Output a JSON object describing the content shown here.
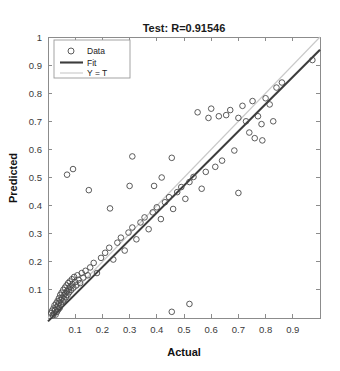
{
  "figure": {
    "title": "Test: R=0.91546",
    "xlabel": "Actual",
    "ylabel": "Predicted"
  },
  "legend": {
    "items": [
      {
        "label": "Data",
        "marker": "circle-marker-icon",
        "color": "#4a4a4a"
      },
      {
        "label": "Fit",
        "marker": "solid-line-icon",
        "color": "#3d3d3d"
      },
      {
        "label": "Y = T",
        "marker": "light-line-icon",
        "color": "#c9c9c9"
      }
    ]
  },
  "colors": {
    "data_marker": "#4a4a4a",
    "fit_line": "#3d3d3d",
    "identity_line": "#c9c9c9",
    "axis": "#8c8c8c",
    "text": "#1a1a1a",
    "background": "#ffffff"
  },
  "chart_data": {
    "type": "scatter",
    "title": "Test: R=0.91546",
    "xlabel": "Actual",
    "ylabel": "Predicted",
    "xlim": [
      0,
      1
    ],
    "ylim": [
      0,
      1
    ],
    "grid": false,
    "legend_position": "upper-left",
    "xticks": [
      0.1,
      0.2,
      0.3,
      0.4,
      0.5,
      0.6,
      0.7,
      0.8,
      0.9
    ],
    "yticks": [
      0.1,
      0.2,
      0.3,
      0.4,
      0.5,
      0.6,
      0.7,
      0.8,
      0.9,
      1
    ],
    "r_value": 0.91546,
    "series": [
      {
        "name": "Data",
        "type": "scatter",
        "points": [
          [
            0.012,
            0.018
          ],
          [
            0.015,
            0.026
          ],
          [
            0.018,
            0.01
          ],
          [
            0.02,
            0.034
          ],
          [
            0.022,
            0.016
          ],
          [
            0.024,
            0.045
          ],
          [
            0.026,
            0.028
          ],
          [
            0.028,
            0.012
          ],
          [
            0.03,
            0.052
          ],
          [
            0.031,
            0.038
          ],
          [
            0.033,
            0.022
          ],
          [
            0.035,
            0.06
          ],
          [
            0.036,
            0.044
          ],
          [
            0.038,
            0.03
          ],
          [
            0.04,
            0.07
          ],
          [
            0.041,
            0.054
          ],
          [
            0.043,
            0.036
          ],
          [
            0.045,
            0.082
          ],
          [
            0.046,
            0.064
          ],
          [
            0.048,
            0.048
          ],
          [
            0.05,
            0.09
          ],
          [
            0.052,
            0.072
          ],
          [
            0.054,
            0.058
          ],
          [
            0.056,
            0.1
          ],
          [
            0.058,
            0.08
          ],
          [
            0.06,
            0.066
          ],
          [
            0.062,
            0.108
          ],
          [
            0.064,
            0.088
          ],
          [
            0.066,
            0.074
          ],
          [
            0.068,
            0.116
          ],
          [
            0.07,
            0.096
          ],
          [
            0.072,
            0.082
          ],
          [
            0.074,
            0.124
          ],
          [
            0.076,
            0.104
          ],
          [
            0.078,
            0.092
          ],
          [
            0.08,
            0.13
          ],
          [
            0.082,
            0.112
          ],
          [
            0.085,
            0.1
          ],
          [
            0.088,
            0.138
          ],
          [
            0.09,
            0.12
          ],
          [
            0.093,
            0.108
          ],
          [
            0.096,
            0.146
          ],
          [
            0.1,
            0.128
          ],
          [
            0.104,
            0.116
          ],
          [
            0.108,
            0.152
          ],
          [
            0.112,
            0.136
          ],
          [
            0.118,
            0.124
          ],
          [
            0.124,
            0.16
          ],
          [
            0.13,
            0.144
          ],
          [
            0.138,
            0.168
          ],
          [
            0.146,
            0.152
          ],
          [
            0.07,
            0.51
          ],
          [
            0.092,
            0.53
          ],
          [
            0.155,
            0.18
          ],
          [
            0.168,
            0.196
          ],
          [
            0.18,
            0.16
          ],
          [
            0.195,
            0.214
          ],
          [
            0.21,
            0.232
          ],
          [
            0.15,
            0.455
          ],
          [
            0.225,
            0.25
          ],
          [
            0.24,
            0.208
          ],
          [
            0.255,
            0.268
          ],
          [
            0.268,
            0.286
          ],
          [
            0.228,
            0.39
          ],
          [
            0.282,
            0.24
          ],
          [
            0.296,
            0.304
          ],
          [
            0.31,
            0.322
          ],
          [
            0.3,
            0.47
          ],
          [
            0.325,
            0.28
          ],
          [
            0.34,
            0.34
          ],
          [
            0.355,
            0.358
          ],
          [
            0.31,
            0.575
          ],
          [
            0.37,
            0.316
          ],
          [
            0.385,
            0.376
          ],
          [
            0.4,
            0.394
          ],
          [
            0.39,
            0.47
          ],
          [
            0.415,
            0.352
          ],
          [
            0.43,
            0.412
          ],
          [
            0.445,
            0.43
          ],
          [
            0.418,
            0.5
          ],
          [
            0.46,
            0.388
          ],
          [
            0.455,
            0.022
          ],
          [
            0.475,
            0.448
          ],
          [
            0.49,
            0.466
          ],
          [
            0.52,
            0.05
          ],
          [
            0.455,
            0.57
          ],
          [
            0.505,
            0.424
          ],
          [
            0.52,
            0.484
          ],
          [
            0.535,
            0.502
          ],
          [
            0.55,
            0.732
          ],
          [
            0.565,
            0.46
          ],
          [
            0.58,
            0.52
          ],
          [
            0.59,
            0.712
          ],
          [
            0.6,
            0.745
          ],
          [
            0.615,
            0.538
          ],
          [
            0.628,
            0.718
          ],
          [
            0.64,
            0.56
          ],
          [
            0.655,
            0.722
          ],
          [
            0.67,
            0.74
          ],
          [
            0.685,
            0.596
          ],
          [
            0.7,
            0.712
          ],
          [
            0.7,
            0.445
          ],
          [
            0.715,
            0.755
          ],
          [
            0.728,
            0.7
          ],
          [
            0.74,
            0.66
          ],
          [
            0.752,
            0.772
          ],
          [
            0.76,
            0.64
          ],
          [
            0.772,
            0.718
          ],
          [
            0.785,
            0.69
          ],
          [
            0.788,
            0.632
          ],
          [
            0.8,
            0.782
          ],
          [
            0.815,
            0.76
          ],
          [
            0.828,
            0.7
          ],
          [
            0.84,
            0.82
          ],
          [
            0.86,
            0.838
          ],
          [
            0.972,
            0.918
          ]
        ]
      }
    ],
    "fit_line": {
      "name": "Fit",
      "x": [
        0.0,
        1.0
      ],
      "y": [
        -0.012,
        0.955
      ]
    },
    "identity_line": {
      "name": "Y = T",
      "x": [
        0.0,
        1.0
      ],
      "y": [
        0.0,
        1.0
      ]
    }
  }
}
